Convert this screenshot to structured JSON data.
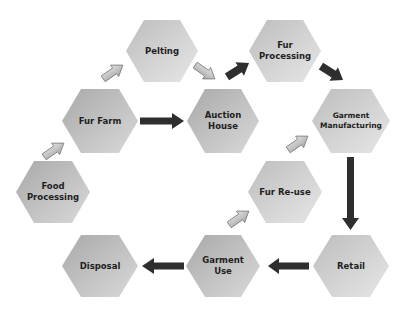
{
  "diagram": {
    "colors": {
      "hex_fill_light": "#e2e2e2",
      "hex_fill_dark": "#a8a8a8",
      "arrow_dark": "#2e2e2e",
      "arrow_light": "#c4c4c4",
      "arrow_light_stroke": "#7a7a7a",
      "text": "#1f1f1f"
    },
    "nodes": [
      {
        "id": "pelting",
        "label": "Pelting",
        "cx": 162,
        "cy": 51
      },
      {
        "id": "fur_processing",
        "label": "Fur\nProcessing",
        "cx": 285,
        "cy": 51
      },
      {
        "id": "fur_farm",
        "label": "Fur Farm",
        "cx": 100,
        "cy": 121
      },
      {
        "id": "auction_house",
        "label": "Auction\nHouse",
        "cx": 223,
        "cy": 121
      },
      {
        "id": "garment_manufacturing",
        "label": "Garment\nManufacturing",
        "cx": 351,
        "cy": 121
      },
      {
        "id": "food_processing",
        "label": "Food\nProcessing",
        "cx": 53,
        "cy": 192
      },
      {
        "id": "fur_reuse",
        "label": "Fur Re-use",
        "cx": 285,
        "cy": 192
      },
      {
        "id": "disposal",
        "label": "Disposal",
        "cx": 100,
        "cy": 266
      },
      {
        "id": "garment_use",
        "label": "Garment\nUse",
        "cx": 223,
        "cy": 266
      },
      {
        "id": "retail",
        "label": "Retail",
        "cx": 351,
        "cy": 266
      }
    ],
    "edges": [
      {
        "from": "food_processing",
        "to": "fur_farm",
        "style": "light"
      },
      {
        "from": "fur_farm",
        "to": "pelting",
        "style": "light"
      },
      {
        "from": "pelting",
        "to": "auction_house",
        "style": "light"
      },
      {
        "from": "fur_farm",
        "to": "auction_house",
        "style": "dark"
      },
      {
        "from": "auction_house",
        "to": "fur_processing",
        "style": "dark"
      },
      {
        "from": "fur_processing",
        "to": "garment_manufacturing",
        "style": "dark"
      },
      {
        "from": "fur_reuse",
        "to": "garment_manufacturing",
        "style": "light"
      },
      {
        "from": "garment_manufacturing",
        "to": "retail",
        "style": "dark"
      },
      {
        "from": "retail",
        "to": "garment_use",
        "style": "dark"
      },
      {
        "from": "garment_use",
        "to": "fur_reuse",
        "style": "light"
      },
      {
        "from": "garment_use",
        "to": "disposal",
        "style": "dark"
      }
    ]
  }
}
